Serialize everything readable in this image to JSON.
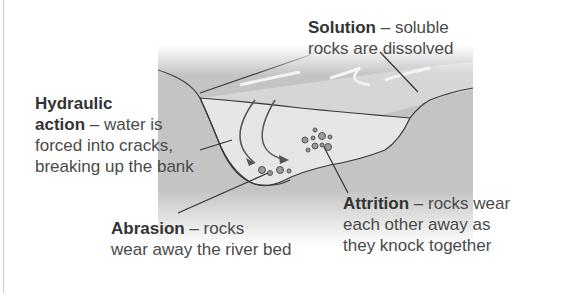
{
  "diagram": {
    "type": "river-erosion-processes",
    "colors": {
      "bank": "#b9b9b9",
      "water": "#e3e3e3",
      "surface": "#cfcfcf",
      "line": "#3a3a3a",
      "text": "#4a4a4a",
      "text_bold": "#333333"
    },
    "labels": {
      "solution": {
        "term": "Solution",
        "dash": " – ",
        "line1_rest": "soluble",
        "line2": "rocks are dissolved"
      },
      "hydraulic": {
        "line1": "Hydraulic",
        "term2": "action",
        "dash": " – ",
        "line2_rest": "water is",
        "line3": "forced into cracks,",
        "line4": "breaking up the bank"
      },
      "abrasion": {
        "term": "Abrasion",
        "dash": " – ",
        "line1_rest": "rocks",
        "line2": "wear away the river bed"
      },
      "attrition": {
        "term": "Attrition",
        "dash": " – ",
        "line1_rest": "rocks wear",
        "line2": "each other away as",
        "line3": "they knock together"
      }
    }
  }
}
